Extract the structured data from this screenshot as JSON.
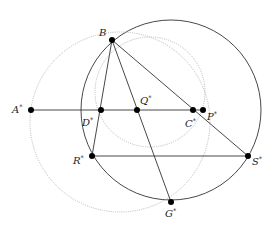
{
  "diagram": {
    "type": "geometric-construction",
    "colors": {
      "solid": "#333333",
      "dotted": "#b8b8b8",
      "point": "#000000",
      "label": "#222222"
    },
    "points": [
      {
        "id": "B",
        "label": "B",
        "sup": "",
        "x": 112,
        "y": 40,
        "lx": 99,
        "ly": 36
      },
      {
        "id": "A",
        "label": "A",
        "sup": "*",
        "x": 31,
        "y": 110,
        "lx": 12,
        "ly": 113
      },
      {
        "id": "D",
        "label": "D",
        "sup": "*",
        "x": 101,
        "y": 110,
        "lx": 82,
        "ly": 126
      },
      {
        "id": "Q",
        "label": "Q",
        "sup": "*",
        "x": 137,
        "y": 110,
        "lx": 140,
        "ly": 104
      },
      {
        "id": "C",
        "label": "C",
        "sup": "*",
        "x": 193,
        "y": 110,
        "lx": 185,
        "ly": 127
      },
      {
        "id": "P",
        "label": "P",
        "sup": "*",
        "x": 203,
        "y": 110,
        "lx": 207,
        "ly": 120
      },
      {
        "id": "R",
        "label": "R",
        "sup": "*",
        "x": 92,
        "y": 156,
        "lx": 73,
        "ly": 164
      },
      {
        "id": "S",
        "label": "S",
        "sup": "*",
        "x": 248,
        "y": 156,
        "lx": 252,
        "ly": 165
      },
      {
        "id": "G",
        "label": "G",
        "sup": "*",
        "x": 171,
        "y": 202,
        "lx": 165,
        "ly": 217
      }
    ],
    "segments": [
      {
        "from": "A",
        "to": "P",
        "style": "solid"
      },
      {
        "from": "R",
        "to": "S",
        "style": "solid"
      },
      {
        "from": "B",
        "to": "R",
        "style": "solid"
      },
      {
        "from": "B",
        "to": "G",
        "style": "solid"
      },
      {
        "from": "B",
        "to": "S",
        "style": "solid"
      }
    ],
    "circles": [
      {
        "name": "main-circle",
        "cx": 171,
        "cy": 110,
        "r": 90,
        "style": "solid"
      },
      {
        "name": "outer-dotted-circle",
        "cx": 120,
        "cy": 122,
        "r": 90,
        "style": "dotted"
      },
      {
        "name": "inner-dotted-circle",
        "cx": 150,
        "cy": 92,
        "r": 55,
        "style": "dotted"
      }
    ]
  }
}
